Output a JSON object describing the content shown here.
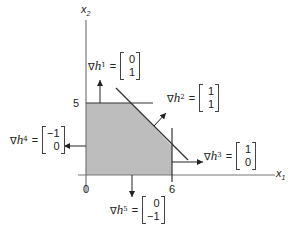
{
  "axes": {
    "x_label": "x",
    "x_sub": "1",
    "y_label": "x",
    "y_sub": "2",
    "tick_x_origin": "0",
    "tick_x_6": "6",
    "tick_y_5": "5"
  },
  "region": {
    "fill": "#bdbdbd",
    "description": "feasible region 0<=x1<=6, 0<=x2<=5, x1+x2<=c"
  },
  "gradients": [
    {
      "id": "h1",
      "symbol": "∇",
      "name": "h",
      "sup": "1",
      "eq": "=",
      "v": [
        "0",
        "1"
      ]
    },
    {
      "id": "h2",
      "symbol": "∇",
      "name": "h",
      "sup": "2",
      "eq": "=",
      "v": [
        "1",
        "1"
      ]
    },
    {
      "id": "h3",
      "symbol": "∇",
      "name": "h",
      "sup": "3",
      "eq": "=",
      "v": [
        "1",
        "0"
      ]
    },
    {
      "id": "h4",
      "symbol": "∇",
      "name": "h",
      "sup": "4",
      "eq": "=",
      "v": [
        "−1",
        "0"
      ]
    },
    {
      "id": "h5",
      "symbol": "∇",
      "name": "h",
      "sup": "5",
      "eq": "=",
      "v": [
        "0",
        "−1"
      ]
    }
  ]
}
